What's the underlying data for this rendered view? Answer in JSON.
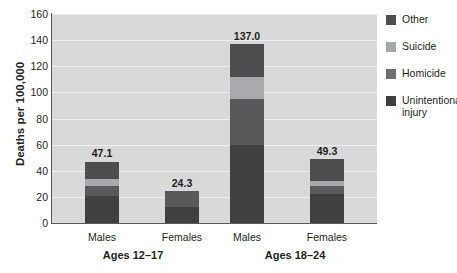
{
  "chart_data": {
    "type": "bar",
    "title": "",
    "subtitle": "",
    "xlabel": "",
    "ylabel": "Deaths per 100,000",
    "ylim": [
      0,
      160
    ],
    "yticks": [
      0,
      20,
      40,
      60,
      80,
      100,
      120,
      140,
      160
    ],
    "ytick_labels": [
      "0",
      "20",
      "40",
      "60",
      "80",
      "100",
      "120",
      "140",
      "160"
    ],
    "grid": true,
    "stacked": true,
    "legend_position": "right",
    "categories": [
      "Males",
      "Females",
      "Males",
      "Females"
    ],
    "groups": [
      {
        "label": "Ages 12–17",
        "categories": [
          "Males",
          "Females"
        ]
      },
      {
        "label": "Ages 18–24",
        "categories": [
          "Males",
          "Females"
        ]
      }
    ],
    "series": [
      {
        "name": "Unintentional injury",
        "color": "#3f4042",
        "values": [
          21.0,
          12.5,
          60.0,
          22.0
        ]
      },
      {
        "name": "Homicide",
        "color": "#58595b",
        "values": [
          7.5,
          11.8,
          35.0,
          6.5
        ]
      },
      {
        "name": "Suicide",
        "color": "#a7a9ac",
        "values": [
          5.0,
          0.0,
          17.0,
          4.0
        ]
      },
      {
        "name": "Other",
        "color": "#4d4e50",
        "values": [
          13.6,
          0.0,
          25.0,
          16.8
        ]
      }
    ],
    "totals": [
      47.1,
      24.3,
      137.0,
      49.3
    ],
    "total_labels": [
      "47.1",
      "24.3",
      "137.0",
      "49.3"
    ]
  },
  "legend": {
    "items": [
      {
        "label": "Other",
        "color": "#4d4e50"
      },
      {
        "label": "Suicide",
        "color": "#a7a9ac"
      },
      {
        "label": "Homicide",
        "color": "#6d6e71"
      },
      {
        "label": "Unintentional injury",
        "color": "#3f4042"
      }
    ]
  },
  "axis": {
    "y_title": "Deaths per 100,000",
    "ticks": [
      "160",
      "140",
      "120",
      "100",
      "80",
      "60",
      "40",
      "20",
      "0"
    ]
  },
  "labels": {
    "males_1": "Males",
    "females_1": "Females",
    "males_2": "Males",
    "females_2": "Females",
    "group_1": "Ages 12–17",
    "group_2": "Ages 18–24"
  },
  "values": {
    "males_1": "47.1",
    "females_1": "24.3",
    "males_2": "137.0",
    "females_2": "49.3"
  },
  "colors": {
    "plot_background": "#d9d9d9",
    "gridline": "#efefef",
    "axis": "#58595b",
    "text": "#231f20"
  }
}
